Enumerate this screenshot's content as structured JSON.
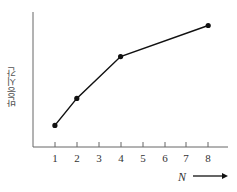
{
  "chart_data": {
    "type": "line",
    "title": "",
    "xlabel": "N",
    "ylabel": "반응시간",
    "x_ticks": [
      "1",
      "2",
      "3",
      "4",
      "5",
      "6",
      "7",
      "8"
    ],
    "x": [
      1,
      2,
      4,
      8
    ],
    "series": [
      {
        "name": "반응시간",
        "values": [
          16,
          36,
          67,
          90
        ]
      }
    ],
    "y_units": "relative (no y-axis ticks shown; 0-100 estimated scale)",
    "ylim": [
      0,
      100
    ],
    "xlim": [
      0,
      9
    ],
    "grid": false,
    "legend": "none",
    "markers": "filled circles",
    "x_axis_arrow": true
  },
  "colors": {
    "line": "#111111",
    "axis": "#555555",
    "text": "#333333"
  }
}
